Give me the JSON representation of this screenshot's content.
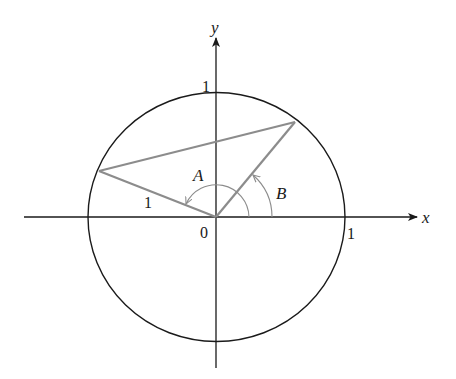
{
  "diagram": {
    "type": "unit-circle",
    "colors": {
      "axes": "#1a1a1a",
      "circle": "#1a1a1a",
      "segments": "#8c8c8c",
      "arcs": "#8c8c8c"
    },
    "axes": {
      "x_label": "x",
      "y_label": "y",
      "origin_label": "0",
      "x_tick_label": "1",
      "y_tick_label": "1"
    },
    "angles": {
      "A_label": "A",
      "B_label": "B"
    },
    "segment_label": "1"
  }
}
